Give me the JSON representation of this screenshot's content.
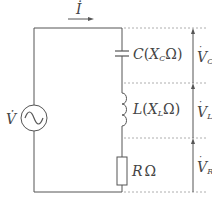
{
  "diagram": {
    "type": "series RLC circuit",
    "current": {
      "symbol": "İ",
      "label": "I"
    },
    "source": {
      "symbol": "V̇",
      "label": "V"
    },
    "components": [
      {
        "id": "capacitor",
        "label": "C",
        "paren_open": "(",
        "reactance": "X",
        "sub": "C",
        "unit": "Ω)"
      },
      {
        "id": "inductor",
        "label": "L",
        "paren_open": "(",
        "reactance": "X",
        "sub": "L",
        "unit": "Ω)"
      },
      {
        "id": "resistor",
        "label": "R",
        "unit": "Ω"
      }
    ],
    "voltages": [
      {
        "main": "V",
        "sub": "C"
      },
      {
        "main": "V",
        "sub": "L"
      },
      {
        "main": "V",
        "sub": "R"
      }
    ],
    "colors": {
      "line": "#555555",
      "dashed": "#999999"
    }
  }
}
